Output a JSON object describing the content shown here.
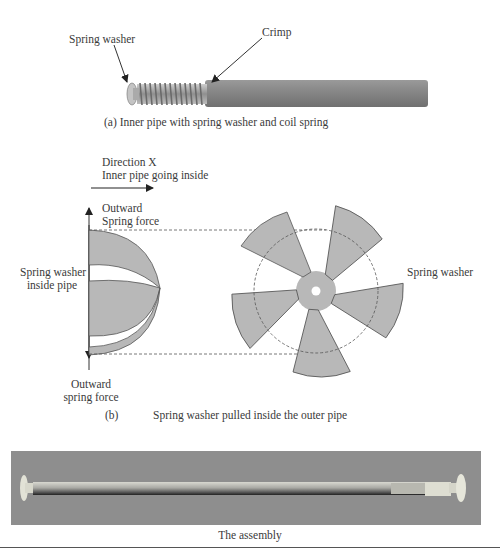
{
  "part_a": {
    "label_spring_washer": "Spring washer",
    "label_crimp": "Crimp",
    "caption": "(a)   Inner pipe with spring washer and coil spring"
  },
  "part_b": {
    "direction_line1": "Direction X",
    "direction_line2": "Inner pipe going inside",
    "outward_top_line1": "Outward",
    "outward_top_line2": "Spring force",
    "washer_inside_line1": "Spring washer",
    "washer_inside_line2": "inside pipe",
    "outward_bottom_line1": "Outward",
    "outward_bottom_line2": "spring force",
    "label_spring_washer_right": "Spring washer",
    "caption_letter": "(b)",
    "caption_text": "Spring washer pulled inside the outer pipe"
  },
  "part_c": {
    "caption": "The assembly"
  },
  "colors": {
    "part_fill": "#b8b8b8",
    "pipe_fill": "#8c8c8c",
    "assembly_bg": "#8e8e8e",
    "line": "#444444"
  }
}
